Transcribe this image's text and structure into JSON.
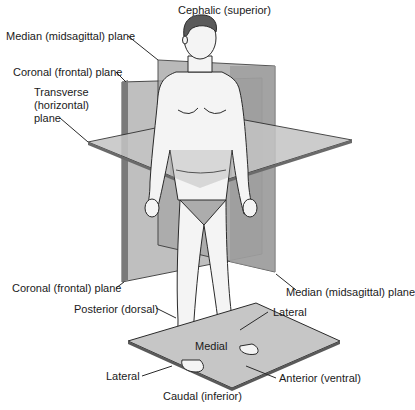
{
  "diagram": {
    "labels": {
      "cephalic": "Cephalic (superior)",
      "median_top": "Median (midsagittal) plane",
      "coronal_top": "Coronal (frontal) plane",
      "transverse_line1": "Transverse",
      "transverse_line2": "(horizontal)",
      "transverse_line3": "plane",
      "coronal_bottom": "Coronal (frontal) plane",
      "median_bottom": "Median (midsagittal) plane",
      "posterior": "Posterior (dorsal)",
      "lateral_right": "Lateral",
      "medial": "Medial",
      "lateral_left": "Lateral",
      "anterior": "Anterior (ventral)",
      "caudal": "Caudal (inferior)"
    },
    "colors": {
      "plane_fill": "#b9b9b9",
      "plane_dark": "#8a8a8a",
      "outline": "#2a2a2a",
      "skin": "#f4f4f4",
      "hair": "#5a5a5a",
      "background": "#ffffff"
    }
  }
}
